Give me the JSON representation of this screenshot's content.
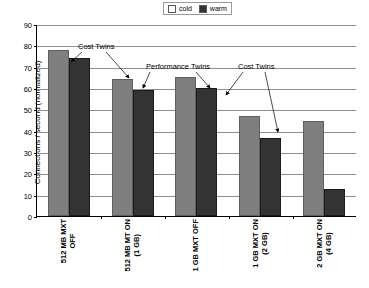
{
  "chart_data": {
    "type": "bar",
    "title": "",
    "xlabel": "",
    "ylabel": "Connections / second (normalized)",
    "ylim": [
      0,
      90
    ],
    "ytick_step": 10,
    "yticks": [
      90,
      80,
      70,
      60,
      50,
      40,
      30,
      20,
      10,
      0
    ],
    "grid": true,
    "legend_position": "top-center",
    "categories": [
      "512 MB MXT OFF",
      "512 MB MT ON (1 GB)",
      "1 GB MXT OFF",
      "1 GB MXT ON (2 GB)",
      "2 GB MXT ON (4 GB)"
    ],
    "category_lines": [
      {
        "line1": "512 MB MXT",
        "line2": "OFF"
      },
      {
        "line1": "512 MB MT ON",
        "line2": "(1 GB)"
      },
      {
        "line1": "1 GB MXT OFF",
        "line2": ""
      },
      {
        "line1": "1 GB MXT ON",
        "line2": "(2 GB)"
      },
      {
        "line1": "2 GB MXT ON",
        "line2": "(4 GB)"
      }
    ],
    "series": [
      {
        "name": "cold",
        "color": "#7f7f7f",
        "values": [
          78,
          64,
          65,
          47,
          44.5
        ]
      },
      {
        "name": "warm",
        "color": "#333333",
        "values": [
          74,
          59,
          60,
          36.5,
          12.5
        ]
      }
    ],
    "annotations": [
      {
        "text": "Cost Twins",
        "id": "cost-twins-left"
      },
      {
        "text": "Performance Twins",
        "id": "performance-twins"
      },
      {
        "text": "Cost Twins",
        "id": "cost-twins-right"
      }
    ]
  },
  "legend": {
    "items": [
      {
        "label": "cold",
        "color": "#7f7f7f"
      },
      {
        "label": "warm",
        "color": "#333333"
      }
    ]
  }
}
